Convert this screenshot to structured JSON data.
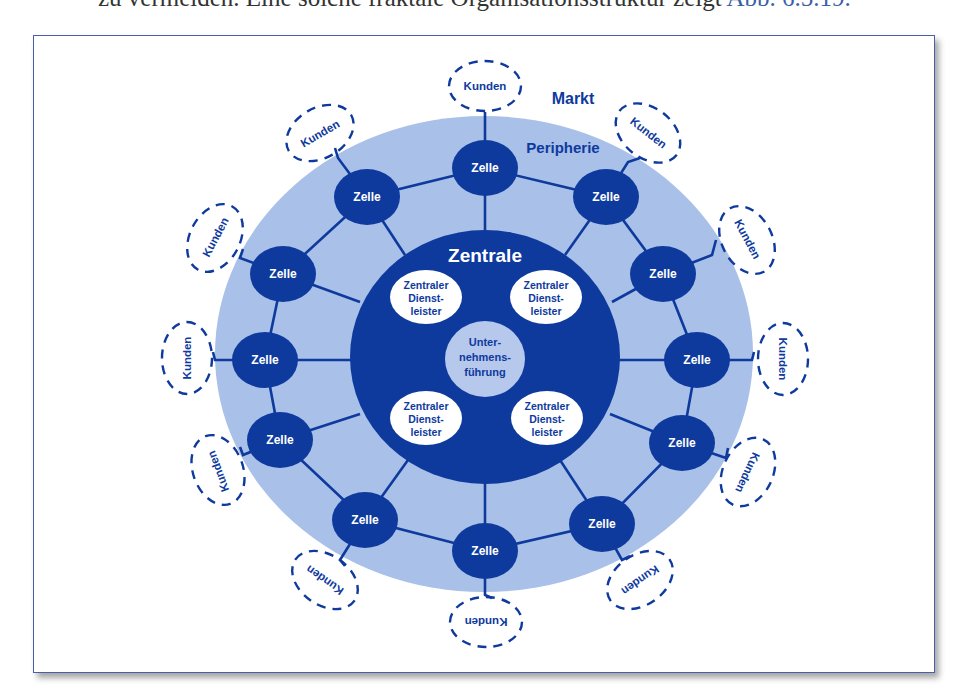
{
  "intro_text": {
    "before": "zu vermeiden. Eine solche fraktale Organisationsstruktur zeigt ",
    "reference": "Abb. 6.5.19."
  },
  "diagram": {
    "title_market": "Markt",
    "title_periphery": "Peripherie",
    "title_center": "Zentrale",
    "core": [
      "Unter-",
      "nehmens-",
      "führung"
    ],
    "service_provider": [
      "Zentraler",
      "Dienst-",
      "leister"
    ],
    "service_provider_count": 4,
    "cell_label": "Zelle",
    "cell_count": 12,
    "customer_label": "Kunden",
    "customer_count": 12,
    "colors": {
      "dark_blue": "#0e3a9e",
      "periphery_blue": "#a9c0e8",
      "core_blue": "#b6c8ec",
      "frame": "#4a5fa8"
    }
  }
}
